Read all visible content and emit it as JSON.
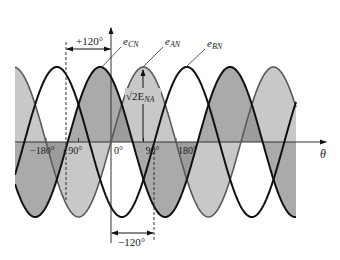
{
  "diagram": {
    "axis": {
      "x_label": "θ",
      "ticks": [
        {
          "deg": -180,
          "label": "−180°"
        },
        {
          "deg": -90,
          "label": "−90°"
        },
        {
          "deg": 0,
          "label": "0°"
        },
        {
          "deg": 90,
          "label": "90°"
        },
        {
          "deg": 180,
          "label": "180°"
        }
      ]
    },
    "curves": [
      {
        "name": "e_AN",
        "label_main": "e",
        "label_sub": "AN",
        "phase_deg": 0,
        "fill": "#c8c8c8",
        "stroke": "#5a5a5a",
        "stroke_width": 1.6
      },
      {
        "name": "e_CN",
        "label_main": "e",
        "label_sub": "CN",
        "phase_deg": 120,
        "fill": "#8e8e8e",
        "stroke": "#111111",
        "stroke_width": 2
      },
      {
        "name": "e_BN",
        "label_main": "e",
        "label_sub": "BN",
        "phase_deg": -120,
        "fill": "none",
        "stroke": "#111111",
        "stroke_width": 2
      }
    ],
    "annotations": {
      "peak_label": "√2E",
      "peak_label_sub": "NA",
      "plus_shift": "+120°",
      "minus_shift": "−120°"
    },
    "geometry": {
      "origin_x": 111,
      "axis_y": 142,
      "px_per_deg": 0.3611,
      "amplitude": 75,
      "x_start": 15,
      "x_end": 296,
      "axis_end_x": 326
    }
  }
}
